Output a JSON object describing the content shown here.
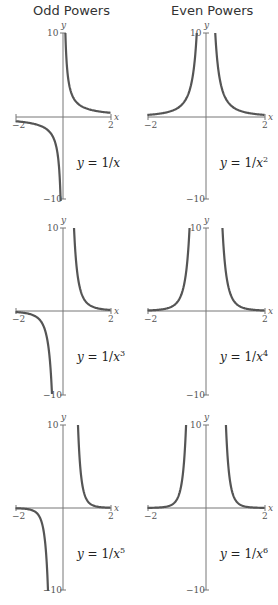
{
  "columns": [
    {
      "title": "Odd Powers"
    },
    {
      "title": "Even Powers"
    }
  ],
  "chart_data": [
    {
      "type": "line",
      "title": "y = 1/x",
      "function": "1/x",
      "power": 1,
      "xlim": [
        -2,
        2
      ],
      "ylim": [
        -10,
        10
      ],
      "xticks": [
        "-2",
        "2"
      ],
      "yticks": [
        "10",
        "-10"
      ],
      "xlabel": "x",
      "ylabel": "y",
      "label": "y = 1/x"
    },
    {
      "type": "line",
      "title": "y = 1/x^2",
      "function": "1/x^2",
      "power": 2,
      "xlim": [
        -2,
        2
      ],
      "ylim": [
        -10,
        10
      ],
      "xticks": [
        "-2",
        "2"
      ],
      "yticks": [
        "10",
        "-10"
      ],
      "xlabel": "x",
      "ylabel": "y",
      "label": "y = 1/x^2"
    },
    {
      "type": "line",
      "title": "y = 1/x^3",
      "function": "1/x^3",
      "power": 3,
      "xlim": [
        -2,
        2
      ],
      "ylim": [
        -10,
        10
      ],
      "xticks": [
        "-2",
        "2"
      ],
      "yticks": [
        "10",
        "-10"
      ],
      "xlabel": "x",
      "ylabel": "y",
      "label": "y = 1/x^3"
    },
    {
      "type": "line",
      "title": "y = 1/x^4",
      "function": "1/x^4",
      "power": 4,
      "xlim": [
        -2,
        2
      ],
      "ylim": [
        -10,
        10
      ],
      "xticks": [
        "-2",
        "2"
      ],
      "yticks": [
        "10",
        "-10"
      ],
      "xlabel": "x",
      "ylabel": "y",
      "label": "y = 1/x^4"
    },
    {
      "type": "line",
      "title": "y = 1/x^5",
      "function": "1/x^5",
      "power": 5,
      "xlim": [
        -2,
        2
      ],
      "ylim": [
        -10,
        10
      ],
      "xticks": [
        "-2",
        "2"
      ],
      "yticks": [
        "10",
        "-10"
      ],
      "xlabel": "x",
      "ylabel": "y",
      "label": "y = 1/x^5"
    },
    {
      "type": "line",
      "title": "y = 1/x^6",
      "function": "1/x^6",
      "power": 6,
      "xlim": [
        -2,
        2
      ],
      "ylim": [
        -10,
        10
      ],
      "xticks": [
        "-2",
        "2"
      ],
      "yticks": [
        "10",
        "-10"
      ],
      "xlabel": "x",
      "ylabel": "y",
      "label": "y = 1/x^6"
    }
  ],
  "labels": {
    "eq_prefix": "y = 1/",
    "var": "x",
    "x_axis": "x",
    "y_axis": "y",
    "tick_neg2": "−2",
    "tick_pos2": "2",
    "tick_10": "10",
    "tick_neg10": "−10"
  },
  "colors": {
    "curve": "#555555",
    "axis": "#777777"
  }
}
